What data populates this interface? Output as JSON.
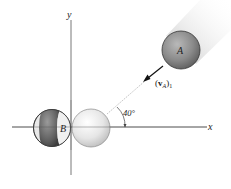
{
  "diagram": {
    "axes": {
      "x_label": "x",
      "y_label": "y"
    },
    "ball_a": {
      "label": "A",
      "color": "#8c8c8c"
    },
    "ball_b": {
      "label": "B",
      "color": "#707070"
    },
    "ball_c": {
      "label": "",
      "color": "#e4e4e4"
    },
    "velocity": {
      "label_open": "(",
      "symbol": "v",
      "subscript_inner": "A",
      "label_close": ")",
      "subscript_outer": "1"
    },
    "angle": {
      "value_label": "40°",
      "degrees": 40
    }
  }
}
